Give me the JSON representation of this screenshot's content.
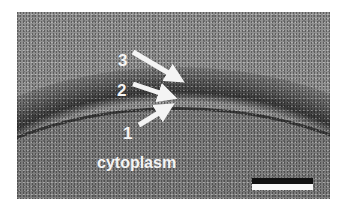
{
  "figure": {
    "type": "electron-micrograph",
    "labels": {
      "layer_3": "3",
      "layer_2": "2",
      "layer_1": "1",
      "region": "cytoplasm"
    },
    "arrows": [
      {
        "label": "3",
        "from": [
          133,
          52
        ],
        "to": [
          181,
          78
        ]
      },
      {
        "label": "2",
        "from": [
          133,
          84
        ],
        "to": [
          172,
          98
        ]
      },
      {
        "label": "1",
        "from": [
          139,
          124
        ],
        "to": [
          168,
          107
        ]
      }
    ],
    "scale_bar": {
      "color_top": "#111111",
      "color_bottom": "#f8f8f8"
    },
    "colors": {
      "background": "#909090",
      "membrane": "#3a3a3a",
      "cytoplasm": "#7c7c7c",
      "label": "#f4f4f4"
    }
  }
}
